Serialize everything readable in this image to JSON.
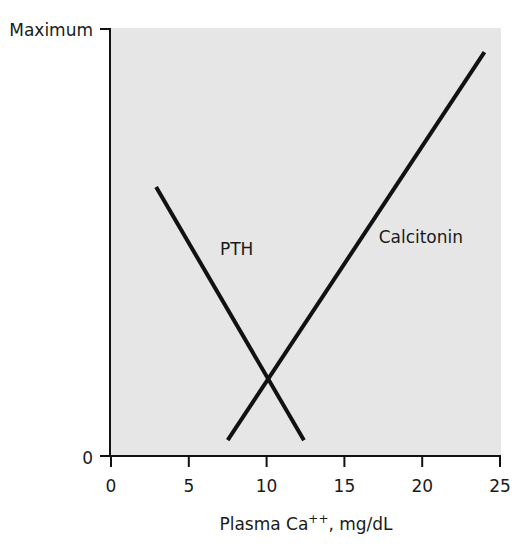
{
  "chart_data": {
    "type": "line",
    "title": "",
    "xlabel": "Plasma Ca++, mg/dL",
    "xlabel_parts": {
      "main": "Plasma Ca",
      "superscript": "++",
      "suffix": ", mg/dL"
    },
    "ylabel": "",
    "xlim": [
      0,
      25
    ],
    "ylim": [
      0,
      100
    ],
    "x_ticks": [
      0,
      5,
      10,
      15,
      20,
      25
    ],
    "x_tick_labels": [
      "0",
      "5",
      "10",
      "15",
      "20",
      "25"
    ],
    "y_ticks": [
      0,
      100
    ],
    "y_tick_labels": [
      "0",
      "Maximum"
    ],
    "grid": false,
    "legend": "none (inline line labels)",
    "background_color": "#e6e6e6",
    "line_color": "#111111",
    "series": [
      {
        "name": "PTH",
        "label": "PTH",
        "x": [
          2.9,
          12.4
        ],
        "y": [
          63,
          3.7
        ],
        "label_pos": [
          7.0,
          47
        ]
      },
      {
        "name": "Calcitonin",
        "label": "Calcitonin",
        "x": [
          7.5,
          24.0
        ],
        "y": [
          3.7,
          94.6
        ],
        "label_pos": [
          17.2,
          50
        ]
      }
    ],
    "annotations": [
      {
        "type": "intersection",
        "x": 10.1,
        "y": 18
      }
    ]
  }
}
